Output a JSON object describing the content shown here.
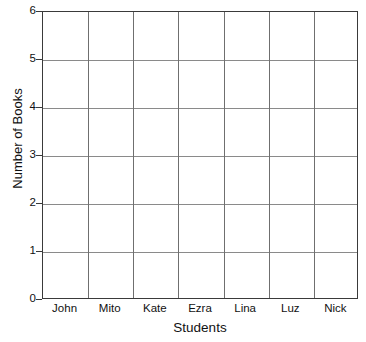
{
  "chart_data": {
    "type": "bar",
    "title": "",
    "xlabel": "Students",
    "ylabel": "Number of Books",
    "categories": [
      "John",
      "Mito",
      "Kate",
      "Ezra",
      "Lina",
      "Luz",
      "Nick"
    ],
    "values": [
      null,
      null,
      null,
      null,
      null,
      null,
      null
    ],
    "ylim": [
      0,
      6
    ],
    "yticks": [
      "0",
      "1",
      "2",
      "3",
      "4",
      "5",
      "6"
    ],
    "ytick_values": [
      0,
      1,
      2,
      3,
      4,
      5,
      6
    ],
    "grid": true,
    "legend": false,
    "note": "blank grid template, no bars drawn",
    "colors": {
      "background": "#ffffff",
      "border": "#3a3a3a",
      "gridline_horizontal": "#8a8a8a",
      "gridline_vertical": "#6f6f6f",
      "text": "#111111"
    }
  }
}
